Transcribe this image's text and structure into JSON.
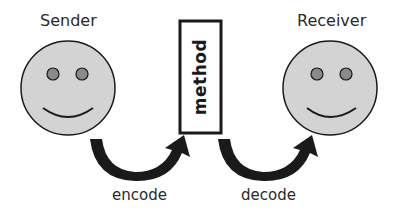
{
  "diagram": {
    "sender": {
      "label": "Sender"
    },
    "receiver": {
      "label": "Receiver"
    },
    "channel": {
      "label": "method"
    },
    "arrows": [
      {
        "label": "encode",
        "from": "sender",
        "to": "method"
      },
      {
        "label": "decode",
        "from": "method",
        "to": "receiver"
      }
    ],
    "colors": {
      "face": "#d3d3d3",
      "eye": "#8a8a8a",
      "stroke": "#1a1a1a"
    }
  }
}
